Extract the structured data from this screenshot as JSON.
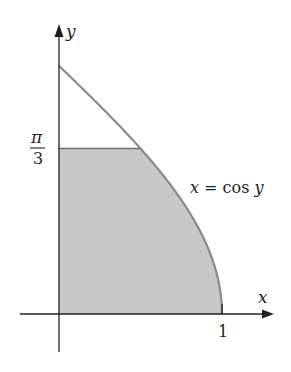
{
  "figure": {
    "type": "region-under-curve",
    "curve_equation": "x = cos y",
    "shaded_region": "0 ≤ y ≤ π/3, 0 ≤ x ≤ cos y",
    "colors": {
      "axis": "#231f20",
      "curve": "#8a8a8a",
      "fill": "#c8c8c8"
    }
  },
  "labels": {
    "x_axis": "x",
    "y_axis": "y",
    "x_tick_one": "1",
    "y_tick_numerator": "π",
    "y_tick_denominator": "3",
    "curve": "x = cos y"
  },
  "axes": {
    "x_range": [
      0,
      1.3
    ],
    "y_range": [
      -0.27,
      1.84
    ],
    "y_mark": "π/3",
    "x_mark": 1
  }
}
